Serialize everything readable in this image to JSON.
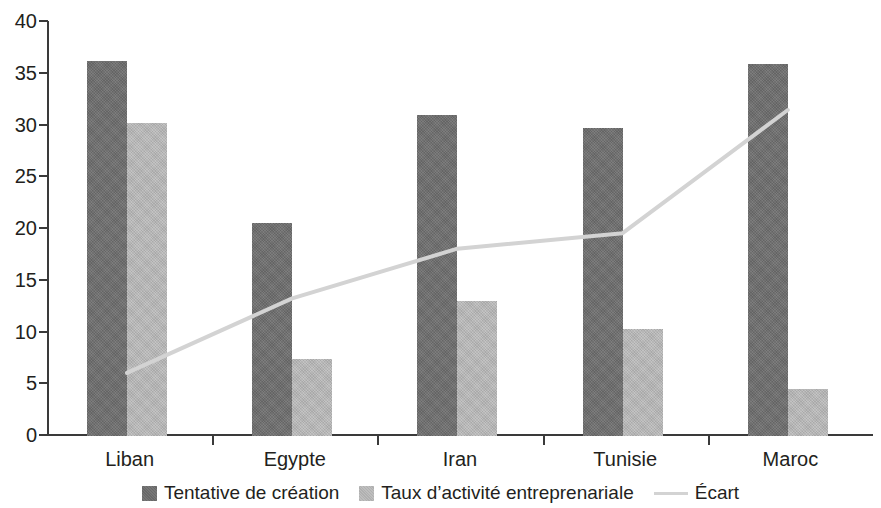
{
  "chart_data": {
    "type": "bar",
    "title": "",
    "subtitle": "",
    "xlabel": "",
    "ylabel": "",
    "categories": [
      "Liban",
      "Egypte",
      "Iran",
      "Tunisie",
      "Maroc"
    ],
    "ylim": [
      0,
      40
    ],
    "yticks": [
      0,
      5,
      10,
      15,
      20,
      25,
      30,
      35,
      40
    ],
    "ytick_labels": [
      "0",
      "5",
      "10",
      "15",
      "20",
      "25",
      "30",
      "35",
      "40"
    ],
    "grid": false,
    "legend_position": "bottom",
    "series": [
      {
        "name": "Tentative de création",
        "type": "bar",
        "color": "#6e6e6e",
        "values": [
          36.2,
          20.6,
          31.0,
          29.8,
          35.9
        ]
      },
      {
        "name": "Taux d’activité entreprenariale",
        "type": "bar",
        "color": "#b9b9b9",
        "values": [
          30.2,
          7.4,
          13.0,
          10.3,
          4.5
        ]
      },
      {
        "name": "Écart",
        "type": "line",
        "color": "#d3d3d3",
        "values": [
          6.0,
          13.2,
          18.0,
          19.5,
          31.4
        ]
      }
    ]
  },
  "axis": {
    "y_ticks": [
      {
        "label": "40",
        "value": 40
      },
      {
        "label": "35",
        "value": 35
      },
      {
        "label": "30",
        "value": 30
      },
      {
        "label": "25",
        "value": 25
      },
      {
        "label": "20",
        "value": 20
      },
      {
        "label": "15",
        "value": 15
      },
      {
        "label": "10",
        "value": 10
      },
      {
        "label": "5",
        "value": 5
      },
      {
        "label": "0",
        "value": 0
      }
    ]
  },
  "legend": {
    "items": [
      {
        "label": "Tentative de création",
        "marker": "square-swatch-dark"
      },
      {
        "label": "Taux d’activité entreprenariale",
        "marker": "square-swatch-light"
      },
      {
        "label": "Écart",
        "marker": "line-swatch"
      }
    ]
  }
}
